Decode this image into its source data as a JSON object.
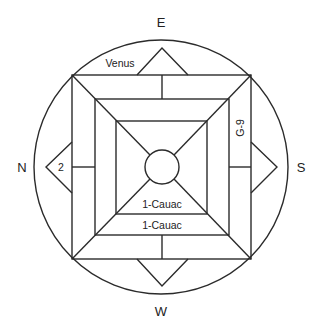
{
  "diagram": {
    "type": "cosmogram",
    "colors": {
      "stroke": "#2b2b2b",
      "text": "#222222",
      "background": "#ffffff"
    },
    "directions": {
      "top": "E",
      "left": "N",
      "right": "S",
      "bottom": "W"
    },
    "labels": {
      "top_left_band": "Venus",
      "left_triangle": "2",
      "right_band_vertical": "G-9",
      "inner_bottom": "1-Cauac",
      "middle_bottom": "1-Cauac"
    },
    "shapes": {
      "outer_circle": {
        "cx": 161,
        "cy": 167,
        "r": 127
      },
      "outer_square": {
        "x1": 72,
        "y1": 75,
        "x2": 251,
        "y2": 259
      },
      "middle_square": {
        "x1": 95,
        "y1": 99,
        "x2": 229,
        "y2": 235
      },
      "inner_square": {
        "x1": 116,
        "y1": 121,
        "x2": 207,
        "y2": 214
      },
      "center_circle": {
        "cx": 162,
        "cy": 167,
        "r": 17
      }
    }
  }
}
